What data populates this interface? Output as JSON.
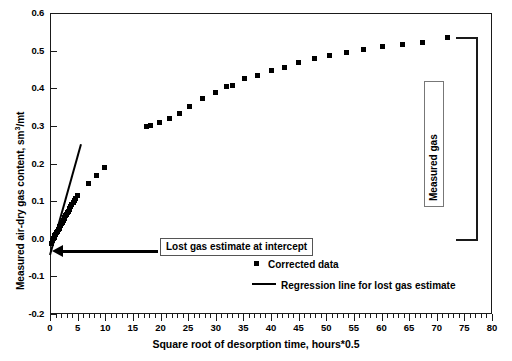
{
  "chart_data": {
    "type": "scatter",
    "title": "",
    "xlabel": "Square root of desorption time, hours*0.5",
    "ylabel": "Measured air-dry gas content, sm3/mt",
    "ylabel_prefix": "Measured air-dry gas content, sm",
    "ylabel_superscript": "3",
    "ylabel_suffix": "/mt",
    "xlim": [
      0,
      80
    ],
    "ylim": [
      -0.2,
      0.6
    ],
    "xticks": [
      0,
      5,
      10,
      15,
      20,
      25,
      30,
      35,
      40,
      45,
      50,
      55,
      60,
      65,
      70,
      75,
      80
    ],
    "xtick_labels": [
      "0",
      "5",
      "10",
      "15",
      "20",
      "25",
      "30",
      "35",
      "40",
      "45",
      "50",
      "55",
      "60",
      "65",
      "70",
      "75",
      "80"
    ],
    "xtick_minor_step": 1,
    "yticks": [
      -0.2,
      -0.1,
      0.0,
      0.1,
      0.2,
      0.3,
      0.4,
      0.5,
      0.6
    ],
    "ytick_labels": [
      "-0.2",
      "-0.1",
      "0.0",
      "0.1",
      "0.2",
      "0.3",
      "0.4",
      "0.5",
      "0.6"
    ],
    "grid": false,
    "legend_position": "bottom-center",
    "series": [
      {
        "name": "Corrected data",
        "marker": "square",
        "color": "#000000",
        "points": [
          [
            0.3,
            -0.012
          ],
          [
            0.45,
            -0.005
          ],
          [
            0.6,
            0.0
          ],
          [
            0.75,
            0.004
          ],
          [
            0.9,
            0.008
          ],
          [
            1.05,
            0.012
          ],
          [
            1.2,
            0.016
          ],
          [
            1.35,
            0.02
          ],
          [
            1.5,
            0.024
          ],
          [
            1.65,
            0.028
          ],
          [
            1.8,
            0.032
          ],
          [
            1.95,
            0.036
          ],
          [
            2.1,
            0.04
          ],
          [
            2.25,
            0.044
          ],
          [
            2.4,
            0.048
          ],
          [
            2.55,
            0.053
          ],
          [
            2.7,
            0.057
          ],
          [
            2.85,
            0.061
          ],
          [
            3.0,
            0.065
          ],
          [
            3.15,
            0.069
          ],
          [
            3.3,
            0.073
          ],
          [
            3.45,
            0.077
          ],
          [
            3.6,
            0.081
          ],
          [
            3.75,
            0.085
          ],
          [
            3.95,
            0.09
          ],
          [
            4.2,
            0.096
          ],
          [
            4.45,
            0.102
          ],
          [
            4.7,
            0.108
          ],
          [
            5.0,
            0.116
          ],
          [
            6.9,
            0.148
          ],
          [
            8.35,
            0.168
          ],
          [
            9.8,
            0.189
          ],
          [
            17.5,
            0.298
          ],
          [
            18.1,
            0.302
          ],
          [
            19.8,
            0.308
          ],
          [
            21.6,
            0.32
          ],
          [
            23.4,
            0.333
          ],
          [
            25.3,
            0.352
          ],
          [
            27.6,
            0.372
          ],
          [
            30.0,
            0.39
          ],
          [
            32.0,
            0.404
          ],
          [
            33.0,
            0.407
          ],
          [
            35.2,
            0.425
          ],
          [
            37.6,
            0.435
          ],
          [
            40.0,
            0.447
          ],
          [
            42.4,
            0.456
          ],
          [
            45.0,
            0.468
          ],
          [
            47.8,
            0.478
          ],
          [
            50.6,
            0.487
          ],
          [
            53.6,
            0.495
          ],
          [
            56.8,
            0.502
          ],
          [
            60.2,
            0.51
          ],
          [
            63.8,
            0.516
          ],
          [
            67.4,
            0.521
          ],
          [
            72.0,
            0.535
          ]
        ]
      }
    ],
    "regression_line": {
      "name": "Regression line for lost gas estimate",
      "color": "#000000",
      "x_start": 0.0,
      "y_start": -0.042,
      "x_end": 5.6,
      "y_end": 0.252,
      "intercept": -0.042
    },
    "annotations": [
      {
        "name": "lost-gas-annotation",
        "text": "Lost gas estimate at intercept",
        "arrow_from_x": 16.0,
        "arrow_to_x": 0.0,
        "arrow_y": -0.032
      },
      {
        "name": "measured-gas-annotation",
        "text": "Measured gas",
        "bracket_top_y": 0.535,
        "bracket_bottom_y": 0.0,
        "bracket_x": 73.5
      }
    ]
  },
  "legend": {
    "items": [
      {
        "label": "Corrected data",
        "symbol": "square-marker"
      },
      {
        "label": "Regression line for lost gas estimate",
        "symbol": "line-segment"
      }
    ]
  }
}
